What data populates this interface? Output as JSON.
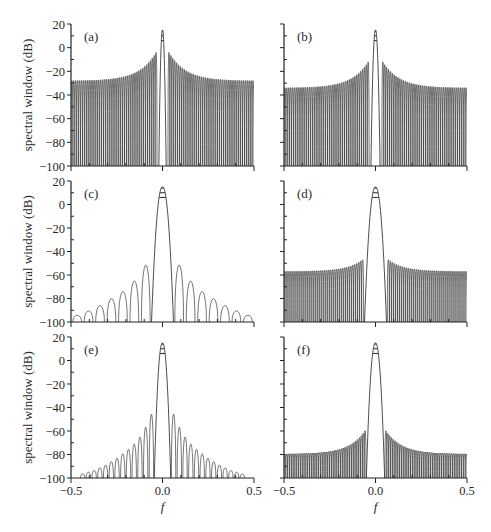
{
  "figure": {
    "ylabel": "spectral window (dB)",
    "xlabel": "f",
    "line_color": "#3a3a3a"
  },
  "chart_data": [
    {
      "type": "line",
      "panel": "(a)",
      "xlabel": "",
      "ylabel": "spectral window (dB)",
      "xlim": [
        -0.5,
        0.5
      ],
      "ylim": [
        -100,
        20
      ],
      "yticks": [
        20,
        0,
        -20,
        -40,
        -60,
        -80,
        -100
      ],
      "xticks": [
        -0.5,
        0.0,
        0.5
      ],
      "main_lobe": {
        "peak_db": 15,
        "half_width": 0.02,
        "level_lines_db": [
          14,
          10,
          6
        ]
      },
      "sidelobes": {
        "pattern": "dense",
        "count_per_side": 45,
        "near_db": -4,
        "far_db": -28,
        "first_offset": 0.03
      }
    },
    {
      "type": "line",
      "panel": "(b)",
      "xlim": [
        -0.5,
        0.5
      ],
      "ylim": [
        -100,
        20
      ],
      "xticks": [
        -0.5,
        0.0,
        0.5
      ],
      "main_lobe": {
        "peak_db": 15,
        "half_width": 0.025,
        "level_lines_db": [
          14,
          10,
          6
        ]
      },
      "sidelobes": {
        "pattern": "dense",
        "count_per_side": 45,
        "near_db": -12,
        "far_db": -34,
        "first_offset": 0.035
      }
    },
    {
      "type": "line",
      "panel": "(c)",
      "xlabel": "",
      "ylabel": "spectral window (dB)",
      "xlim": [
        -0.5,
        0.5
      ],
      "ylim": [
        -100,
        20
      ],
      "yticks": [
        20,
        0,
        -20,
        -40,
        -60,
        -80,
        -100
      ],
      "xticks": [
        -0.5,
        0.0,
        0.5
      ],
      "main_lobe": {
        "peak_db": 15,
        "half_width": 0.06,
        "level_lines_db": [
          14,
          10,
          6
        ]
      },
      "sidelobes": {
        "pattern": "sparse",
        "peaks_db": [
          -38,
          -56,
          -68,
          -76,
          -84,
          -90,
          -95
        ],
        "first_offset": 0.06,
        "spacing": 0.0625
      }
    },
    {
      "type": "line",
      "panel": "(d)",
      "xlim": [
        -0.5,
        0.5
      ],
      "ylim": [
        -100,
        20
      ],
      "xticks": [
        -0.5,
        0.0,
        0.5
      ],
      "main_lobe": {
        "peak_db": 15,
        "half_width": 0.06,
        "level_lines_db": [
          14,
          10,
          6
        ]
      },
      "sidelobes": {
        "pattern": "dense",
        "count_per_side": 40,
        "near_db": -47,
        "far_db": -57,
        "first_offset": 0.065
      }
    },
    {
      "type": "line",
      "panel": "(e)",
      "xlabel": "f",
      "ylabel": "spectral window (dB)",
      "xlim": [
        -0.5,
        0.5
      ],
      "ylim": [
        -100,
        20
      ],
      "yticks": [
        20,
        0,
        -20,
        -40,
        -60,
        -80,
        -100
      ],
      "xticks": [
        -0.5,
        0.0,
        0.5
      ],
      "xticklabels": [
        "-0.5",
        "0.0",
        "0.5"
      ],
      "main_lobe": {
        "peak_db": 15,
        "half_width": 0.045,
        "level_lines_db": [
          14,
          10,
          6
        ]
      },
      "sidelobes": {
        "pattern": "sparse",
        "peaks_db": [
          -30,
          -45,
          -56,
          -64,
          -70,
          -75,
          -80,
          -84,
          -88,
          -91,
          -94,
          -96,
          -98
        ],
        "first_offset": 0.045,
        "spacing": 0.0313
      }
    },
    {
      "type": "line",
      "panel": "(f)",
      "xlabel": "f",
      "xlim": [
        -0.5,
        0.5
      ],
      "ylim": [
        -100,
        20
      ],
      "xticks": [
        -0.5,
        0.0,
        0.5
      ],
      "xticklabels": [
        "-0.5",
        "0.0",
        "0.5"
      ],
      "main_lobe": {
        "peak_db": 15,
        "half_width": 0.05,
        "level_lines_db": [
          14,
          10,
          6
        ]
      },
      "sidelobes": {
        "pattern": "dense",
        "count_per_side": 45,
        "near_db": -60,
        "far_db": -80,
        "first_offset": 0.052
      }
    }
  ],
  "layout": {
    "panels": [
      {
        "x0": 71,
        "x1": 254,
        "y0": 24,
        "y1": 166,
        "show_yticklabels": true,
        "show_xticklabels": false
      },
      {
        "x0": 284,
        "x1": 467,
        "y0": 24,
        "y1": 166,
        "show_yticklabels": false,
        "show_xticklabels": false
      },
      {
        "x0": 71,
        "x1": 254,
        "y0": 181,
        "y1": 322,
        "show_yticklabels": true,
        "show_xticklabels": false
      },
      {
        "x0": 284,
        "x1": 467,
        "y0": 181,
        "y1": 322,
        "show_yticklabels": false,
        "show_xticklabels": false
      },
      {
        "x0": 71,
        "x1": 254,
        "y0": 337,
        "y1": 478,
        "show_yticklabels": true,
        "show_xticklabels": true
      },
      {
        "x0": 284,
        "x1": 467,
        "y0": 337,
        "y1": 478,
        "show_yticklabels": false,
        "show_xticklabels": true
      }
    ]
  }
}
